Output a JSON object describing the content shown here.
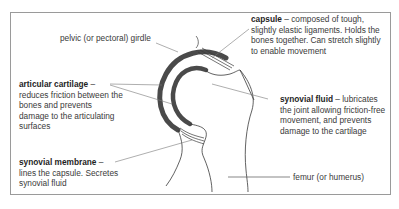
{
  "diagram": {
    "labels": {
      "pelvic_girdle": "pelvic (or pectoral) girdle",
      "capsule": {
        "term": "capsule",
        "desc": " – composed of tough, slightly elastic ligaments. Holds the bones together. Can stretch slightly to enable movement"
      },
      "articular_cartilage": {
        "term": "articular cartilage",
        "desc": " – reduces friction between the bones and prevents damage to the articulating surfaces"
      },
      "synovial_fluid": {
        "term": "synovial fluid",
        "desc": " – lubricates the joint allowing friction-free movement, and prevents damage to the cartilage"
      },
      "synovial_membrane": {
        "term": "synovial membrane",
        "desc": " – lines the capsule. Secretes synovial fluid"
      },
      "femur": "femur (or humerus)"
    },
    "colors": {
      "frame_border": "#9a9a9a",
      "cartilage": "#4a4a4a",
      "outline": "#3a3a3a",
      "text": "#3a3a3a"
    }
  }
}
